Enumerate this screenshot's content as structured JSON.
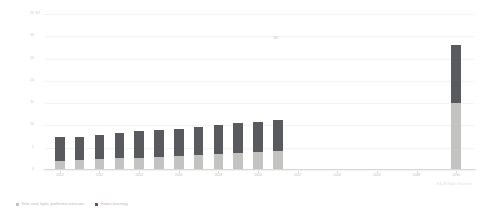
{
  "chart_data": {
    "type": "bar",
    "title": "",
    "subtitle": "",
    "stacked": true,
    "xlabel": "",
    "ylabel": "EJ",
    "ylim": [
      0,
      35
    ],
    "yticks": [
      0,
      5,
      10,
      15,
      20,
      25,
      30,
      35
    ],
    "ytick_labels": [
      "0",
      "5",
      "10",
      "15",
      "20",
      "25",
      "30",
      "35"
    ],
    "grid": true,
    "legend_position": "bottom-left",
    "x": [
      2010,
      2011,
      2012,
      2013,
      2014,
      2015,
      2016,
      2017,
      2018,
      2019,
      2020,
      2021,
      2030
    ],
    "categories": [
      "2010",
      "2011",
      "2012",
      "2013",
      "2014",
      "2015",
      "2016",
      "2017",
      "2018",
      "2019",
      "2020",
      "2021",
      "2030"
    ],
    "xtick_positions": [
      2010,
      2012,
      2014,
      2016,
      2018,
      2020,
      2022,
      2024,
      2026,
      2028,
      2030
    ],
    "xtick_labels": [
      "2010",
      "2012",
      "2014",
      "2016",
      "2018",
      "2020",
      "2022",
      "2024",
      "2026",
      "2028",
      "2030"
    ],
    "series": [
      {
        "name": "Solar, wind, hydro, geothermal and ocean",
        "color": "#c3c4c1",
        "values": [
          2.1,
          2.2,
          2.4,
          2.6,
          2.8,
          3.0,
          3.2,
          3.4,
          3.6,
          3.8,
          4.0,
          4.3,
          15.0
        ]
      },
      {
        "name": "Modern bioenergy",
        "color": "#585a5d",
        "values": [
          5.2,
          5.3,
          5.5,
          5.7,
          5.9,
          6.0,
          6.1,
          6.3,
          6.5,
          6.7,
          6.8,
          7.0,
          13.0
        ]
      }
    ],
    "totals": [
      7.3,
      7.5,
      7.9,
      8.3,
      8.7,
      9.0,
      9.3,
      9.7,
      10.1,
      10.5,
      10.8,
      11.3,
      28.0
    ],
    "annotation": "EJ"
  },
  "axis": {
    "y_unit_label": "EJ"
  },
  "legend": {
    "items": [
      {
        "label": "Solar, wind, hydro, geothermal and ocean",
        "color": "#c3c4c1"
      },
      {
        "label": "Modern bioenergy",
        "color": "#585a5d"
      }
    ]
  },
  "footer": {
    "copyright": "IEA. All Rights Reserved."
  }
}
